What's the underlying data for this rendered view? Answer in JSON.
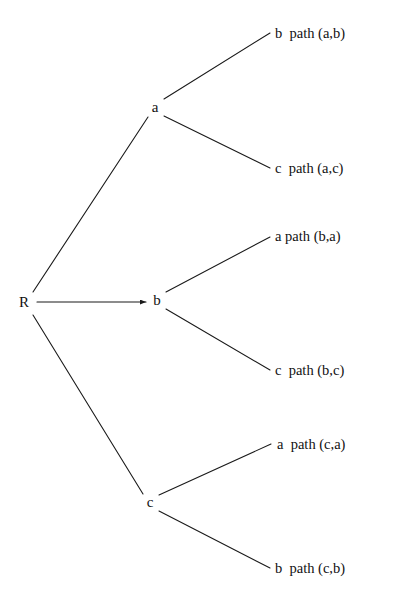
{
  "diagram": {
    "type": "tree",
    "background_color": "#ffffff",
    "line_color": "#1a1a1a",
    "text_color": "#111111",
    "nodes": [
      {
        "id": "R",
        "label": "R",
        "x": 24,
        "y": 302,
        "role": "root"
      },
      {
        "id": "a",
        "label": "a",
        "x": 155,
        "y": 107,
        "role": "internal"
      },
      {
        "id": "b",
        "label": "b",
        "x": 157,
        "y": 300,
        "role": "internal"
      },
      {
        "id": "c",
        "label": "c",
        "x": 150,
        "y": 502,
        "role": "internal"
      }
    ],
    "leaves": [
      {
        "id": "leaf-ab",
        "label": "b  path (a,b)",
        "x": 275,
        "y": 33,
        "parent": "a"
      },
      {
        "id": "leaf-ac",
        "label": "c  path (a,c)",
        "x": 275,
        "y": 168,
        "parent": "a"
      },
      {
        "id": "leaf-ba",
        "label": "a path (b,a)",
        "x": 275,
        "y": 236,
        "parent": "b"
      },
      {
        "id": "leaf-bc",
        "label": "c  path (b,c)",
        "x": 275,
        "y": 370,
        "parent": "b"
      },
      {
        "id": "leaf-ca",
        "label": "a  path (c,a)",
        "x": 277,
        "y": 444,
        "parent": "c"
      },
      {
        "id": "leaf-cb",
        "label": "b  path (c,b)",
        "x": 275,
        "y": 568,
        "parent": "c"
      }
    ],
    "edges": [
      {
        "id": "edge-R-a",
        "from": "R",
        "to": "a",
        "x1": 33,
        "y1": 292,
        "x2": 148,
        "y2": 117,
        "arrow": false
      },
      {
        "id": "edge-R-b",
        "from": "R",
        "to": "b",
        "x1": 37,
        "y1": 302,
        "x2": 146,
        "y2": 302,
        "arrow": true
      },
      {
        "id": "edge-R-c",
        "from": "R",
        "to": "c",
        "x1": 33,
        "y1": 315,
        "x2": 143,
        "y2": 494,
        "arrow": false
      },
      {
        "id": "edge-a-ab",
        "from": "a",
        "to": "leaf-ab",
        "x1": 164,
        "y1": 99,
        "x2": 270,
        "y2": 33,
        "arrow": false
      },
      {
        "id": "edge-a-ac",
        "from": "a",
        "to": "leaf-ac",
        "x1": 164,
        "y1": 116,
        "x2": 270,
        "y2": 168,
        "arrow": false
      },
      {
        "id": "edge-b-ba",
        "from": "b",
        "to": "leaf-ba",
        "x1": 166,
        "y1": 292,
        "x2": 270,
        "y2": 237,
        "arrow": false
      },
      {
        "id": "edge-b-bc",
        "from": "b",
        "to": "leaf-bc",
        "x1": 166,
        "y1": 309,
        "x2": 270,
        "y2": 370,
        "arrow": false
      },
      {
        "id": "edge-c-ca",
        "from": "c",
        "to": "leaf-ca",
        "x1": 159,
        "y1": 495,
        "x2": 271,
        "y2": 444,
        "arrow": false
      },
      {
        "id": "edge-c-cb",
        "from": "c",
        "to": "leaf-cb",
        "x1": 159,
        "y1": 511,
        "x2": 270,
        "y2": 568,
        "arrow": false
      }
    ]
  }
}
